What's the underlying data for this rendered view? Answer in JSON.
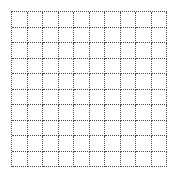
{
  "grid": {
    "rows": 10,
    "columns": 10,
    "line_style": "dotted",
    "line_color": "#4a4a4a",
    "background_color": "#ffffff"
  }
}
